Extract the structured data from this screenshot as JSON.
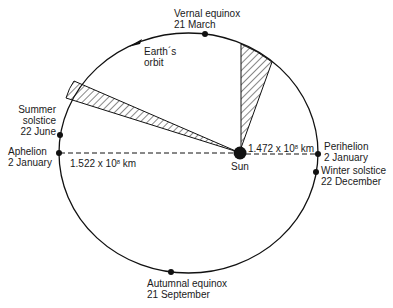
{
  "diagram": {
    "type": "orbit-diagram",
    "colors": {
      "line": "#111111",
      "background": "#ffffff"
    },
    "orbit_label": {
      "line1": "Earth´s",
      "line2": "orbit"
    },
    "sun_label": "Sun",
    "points": [
      {
        "id": "vernal-equinox",
        "name": "Vernal equinox",
        "date": "21 March"
      },
      {
        "id": "summer-solstice",
        "name": "Summer solstice",
        "name_line1": "Summer",
        "name_line2": "solstice",
        "date": "22 June"
      },
      {
        "id": "aphelion",
        "name": "Aphelion",
        "date": "2 January"
      },
      {
        "id": "perihelion",
        "name": "Perihelion",
        "date": "2 January"
      },
      {
        "id": "winter-solstice",
        "name": "Winter solstice",
        "date": "22 December"
      },
      {
        "id": "autumnal-equinox",
        "name": "Autumnal equinox",
        "date": "21 September"
      }
    ],
    "distances": {
      "aphelion": {
        "mantissa": "1.522 x 10",
        "exponent": "8",
        "unit": " km"
      },
      "perihelion": {
        "mantissa": "1.472 x 10",
        "exponent": "8",
        "unit": " km"
      }
    },
    "shaded_sectors": [
      {
        "id": "sector-near-aphelion",
        "description": "narrow hatched wedge from Sun toward upper-left orbit"
      },
      {
        "id": "sector-near-perihelion",
        "description": "wider hatched wedge from Sun toward top-right orbit"
      }
    ]
  }
}
